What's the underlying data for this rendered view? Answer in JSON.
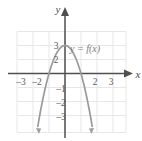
{
  "figure": {
    "name": "graph-of-quadratic-function",
    "background_color": "#ffffff",
    "grid_color": "#e2e2e4",
    "axis_color": "#5a5a5a",
    "curve_color": "#9a9a9a",
    "label_color": "#5a5a5a"
  },
  "axes": {
    "x_axis_label": "x",
    "y_axis_label": "y",
    "x_tick_labels": [
      "–3",
      "–2",
      "2",
      "3"
    ],
    "y_tick_labels": [
      "3",
      "2",
      "–1",
      "–2",
      "–3"
    ]
  },
  "curve": {
    "label": "y = f(x)"
  },
  "chart_data": {
    "type": "line",
    "title": "",
    "xlabel": "x",
    "ylabel": "y",
    "xlim": [
      -3.5,
      3.5
    ],
    "ylim": [
      -3.6,
      3.5
    ],
    "grid": true,
    "legend": "none",
    "annotations": [
      {
        "text": "y = f(x)",
        "x": 1.2,
        "y": 2.55
      }
    ],
    "xticks": [
      -3,
      -2,
      2,
      3
    ],
    "xticklabels": [
      "–3",
      "–2",
      "2",
      "3"
    ],
    "yticks": [
      3,
      2,
      -1,
      -2,
      -3
    ],
    "yticklabels": [
      "3",
      "2",
      "–1",
      "–2",
      "–3"
    ],
    "series": [
      {
        "name": "f(x)",
        "equation": "y = 2 - 2x^2",
        "vertex": [
          0,
          2
        ],
        "opens": "down",
        "x_intercepts": [
          -1,
          1
        ],
        "arrows": [
          "both-ends-downward"
        ],
        "x": [
          -1.7,
          -1.5,
          -1.25,
          -1.0,
          -0.75,
          -0.5,
          -0.25,
          0,
          0.25,
          0.5,
          0.75,
          1.0,
          1.25,
          1.5,
          1.7
        ],
        "y": [
          -3.78,
          -2.5,
          -1.13,
          0,
          0.88,
          1.5,
          1.88,
          2,
          1.88,
          1.5,
          0.88,
          0,
          -1.13,
          -2.5,
          -3.78
        ]
      }
    ]
  }
}
